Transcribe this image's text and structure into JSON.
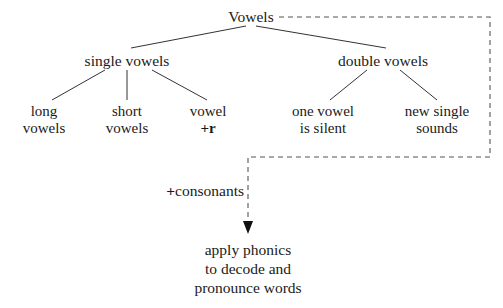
{
  "diagram": {
    "colors": {
      "text": "#1a1a1a",
      "edge": "#333333",
      "dashed_edge": "#555555",
      "background": "#ffffff"
    },
    "root": {
      "label": "Vowels"
    },
    "branches": [
      {
        "label": "single vowels"
      },
      {
        "label": "double vowels"
      }
    ],
    "leaves": [
      {
        "line1": "long",
        "line2": "vowels"
      },
      {
        "line1": "short",
        "line2": "vowels"
      },
      {
        "line1": "vowel",
        "line2": "+r"
      },
      {
        "line1": "one vowel",
        "line2": "is silent"
      },
      {
        "line1": "new single",
        "line2": "sounds"
      }
    ],
    "connector": {
      "label_plus": "+",
      "label_text": "consonants"
    },
    "outcome": {
      "line1": "apply phonics",
      "line2": "to decode and",
      "line3": "pronounce words"
    }
  }
}
